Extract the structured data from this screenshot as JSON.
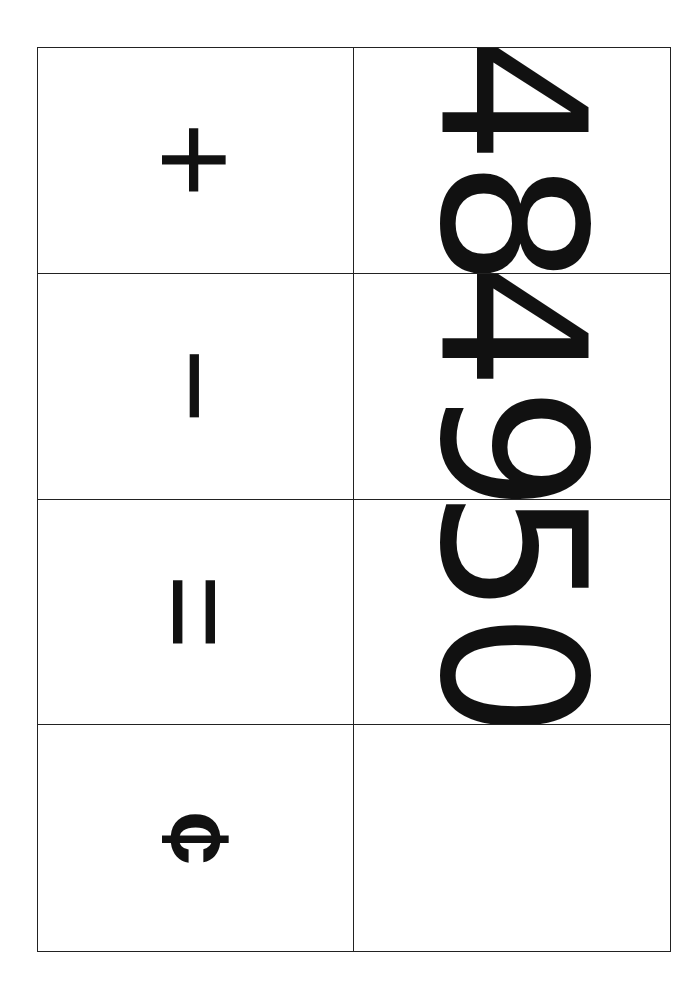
{
  "sheet": {
    "rows": [
      {
        "symbol": "+",
        "symbol_name": "plus",
        "number": "48"
      },
      {
        "symbol": "−",
        "symbol_name": "minus",
        "number": "49"
      },
      {
        "symbol": "=",
        "symbol_name": "equals",
        "number": "50"
      },
      {
        "symbol": "¢",
        "symbol_name": "cent",
        "number": ""
      }
    ],
    "orientation": "rotated-90-clockwise",
    "colors": {
      "ink": "#111111",
      "paper": "#ffffff",
      "grid_line": "#222222"
    }
  }
}
